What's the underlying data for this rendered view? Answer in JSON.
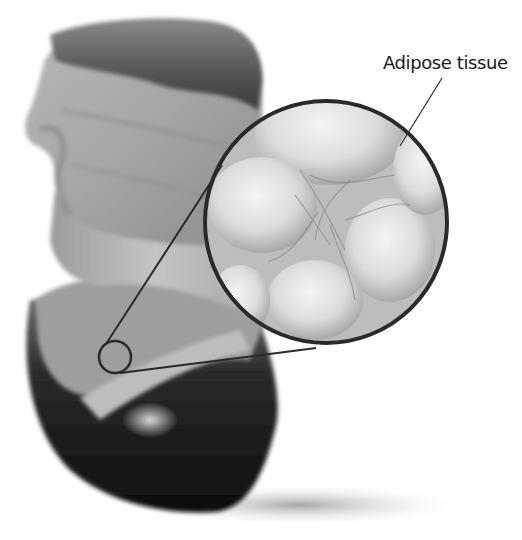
{
  "figure": {
    "callout_label": "Adipose tissue"
  },
  "colors": {
    "background": "#ffffff",
    "outline": "#2a2a2a",
    "skin_light": "#c8c8c8",
    "skin_mid": "#9a9a9a",
    "hair": "#4a4a4a",
    "shirt_dark": "#151515",
    "cell_highlight": "#eeeeee",
    "cell_membrane": "#8a8a8a"
  },
  "geometry": {
    "magnifier_circle": {
      "cx": 326,
      "cy": 222,
      "r": 122
    },
    "source_circle": {
      "cx": 115,
      "cy": 357,
      "r": 16
    },
    "label_pointer": {
      "x1": 442,
      "y1": 78,
      "x2": 400,
      "y2": 146
    }
  }
}
